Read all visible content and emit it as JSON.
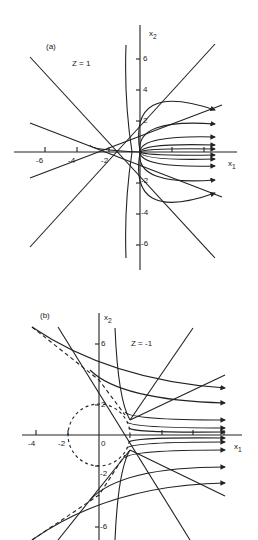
{
  "panel_a": {
    "label": "(a)",
    "param": "Z = 1",
    "x_axis_label": "x",
    "x_axis_sub": "1",
    "y_axis_label": "x",
    "y_axis_sub": "2",
    "x_ticks": [
      "-6",
      "-4",
      "-2"
    ],
    "y_ticks": [
      "6",
      "4",
      "2",
      "-2",
      "-4",
      "-6"
    ]
  },
  "panel_b": {
    "label": "(b)",
    "param": "Z = -1",
    "x_axis_label": "x",
    "x_axis_sub": "1",
    "y_axis_label": "x",
    "y_axis_sub": "2",
    "x_ticks": [
      "-4",
      "-2",
      "0"
    ],
    "y_ticks": [
      "6",
      "2",
      "-2",
      "-6"
    ]
  }
}
